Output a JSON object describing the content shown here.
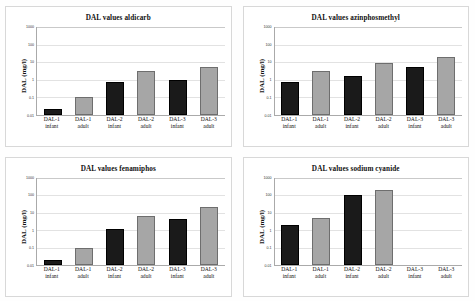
{
  "figure": {
    "axis_label": "DAL (mg/l)",
    "y_ticks": [
      "1000",
      "100",
      "10",
      "1",
      "0.1",
      "0.01"
    ],
    "categories": [
      {
        "line1": "DAL-1",
        "line2": "infant"
      },
      {
        "line1": "DAL-1",
        "line2": "adult"
      },
      {
        "line1": "DAL-2",
        "line2": "infant"
      },
      {
        "line1": "DAL-2",
        "line2": "adult"
      },
      {
        "line1": "DAL-3",
        "line2": "infant"
      },
      {
        "line1": "DAL-3",
        "line2": "adult"
      }
    ],
    "colors": {
      "infant_bar": "#1a1a1a",
      "adult_bar": "#a6a6a6",
      "grid": "#e2e2e2",
      "axis": "#aaaaaa",
      "background": "#ffffff"
    }
  },
  "chart_data": [
    {
      "type": "bar",
      "title": "DAL values aldicarb",
      "xlabel": "",
      "ylabel": "DAL (mg/l)",
      "yscale": "log",
      "ylim": [
        0.01,
        1000
      ],
      "yticks": [
        0.01,
        0.1,
        1,
        10,
        100,
        1000
      ],
      "grid": true,
      "legend": "none",
      "categories": [
        "DAL-1 infant",
        "DAL-1 adult",
        "DAL-2 infant",
        "DAL-2 adult",
        "DAL-3 infant",
        "DAL-3 adult"
      ],
      "groups": [
        "infant",
        "adult",
        "infant",
        "adult",
        "infant",
        "adult"
      ],
      "values": [
        0.02,
        0.1,
        0.7,
        3,
        1,
        5
      ]
    },
    {
      "type": "bar",
      "title": "DAL values azinphosmethyl",
      "xlabel": "",
      "ylabel": "DAL (mg/l)",
      "yscale": "log",
      "ylim": [
        0.01,
        1000
      ],
      "yticks": [
        0.01,
        0.1,
        1,
        10,
        100,
        1000
      ],
      "grid": true,
      "legend": "none",
      "categories": [
        "DAL-1 infant",
        "DAL-1 adult",
        "DAL-2 infant",
        "DAL-2 adult",
        "DAL-3 infant",
        "DAL-3 adult"
      ],
      "groups": [
        "infant",
        "adult",
        "infant",
        "adult",
        "infant",
        "adult"
      ],
      "values": [
        0.7,
        3,
        1.5,
        9,
        5,
        20
      ]
    },
    {
      "type": "bar",
      "title": "DAL values fenamiphos",
      "xlabel": "",
      "ylabel": "DAL (mg/l)",
      "yscale": "log",
      "ylim": [
        0.01,
        1000
      ],
      "yticks": [
        0.01,
        0.1,
        1,
        10,
        100,
        1000
      ],
      "grid": true,
      "legend": "none",
      "categories": [
        "DAL-1 infant",
        "DAL-1 adult",
        "DAL-2 infant",
        "DAL-2 adult",
        "DAL-3 infant",
        "DAL-3 adult"
      ],
      "groups": [
        "infant",
        "adult",
        "infant",
        "adult",
        "infant",
        "adult"
      ],
      "values": [
        0.02,
        0.09,
        1.1,
        6,
        4,
        20
      ]
    },
    {
      "type": "bar",
      "title": "DAL values sodium cyanide",
      "xlabel": "",
      "ylabel": "DAL (mg/l)",
      "yscale": "log",
      "ylim": [
        0.01,
        1000
      ],
      "yticks": [
        0.01,
        0.1,
        1,
        10,
        100,
        1000
      ],
      "grid": true,
      "legend": "none",
      "categories": [
        "DAL-1 infant",
        "DAL-1 adult",
        "DAL-2 infant",
        "DAL-2 adult",
        "DAL-3 infant",
        "DAL-3 adult"
      ],
      "groups": [
        "infant",
        "adult",
        "infant",
        "adult",
        "infant",
        "adult"
      ],
      "values": [
        2,
        5,
        100,
        200,
        null,
        null
      ]
    }
  ]
}
